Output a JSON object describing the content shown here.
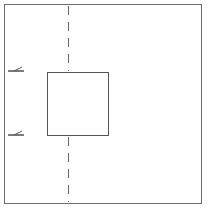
{
  "diagram": {
    "title": "",
    "elements": {
      "outer_frame": {
        "x": 4,
        "y": 4,
        "width": 197,
        "height": 199,
        "stroke": "#6e6e6e"
      },
      "inner_square": {
        "x": 47,
        "y": 72,
        "width": 61,
        "height": 63,
        "stroke": "#555555"
      },
      "center_line": {
        "x": 68,
        "style": "dashed",
        "stroke": "#666666"
      },
      "markers": [
        {
          "name": "upper-arrow",
          "y": 70,
          "direction": "left"
        },
        {
          "name": "lower-arrow",
          "y": 134,
          "direction": "left"
        }
      ]
    },
    "colors": {
      "background": "#ffffff",
      "line": "#5a5a5a"
    }
  }
}
